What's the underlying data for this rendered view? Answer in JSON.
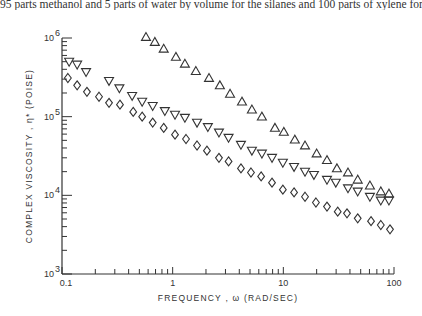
{
  "caption": "95 parts methanol and 5 parts of water by volume for the silanes and 100 parts of xylene for th",
  "chart_data": {
    "type": "scatter",
    "title": "",
    "xlabel": "FREQUENCY , ω (RAD/SEC)",
    "ylabel": "COMPLEX VISCOSITY , η* (POISE)",
    "xscale": "log",
    "yscale": "log",
    "xlim": [
      0.1,
      100
    ],
    "ylim": [
      1000,
      1000000
    ],
    "grid": false,
    "x_ticks": [
      {
        "value": 0.1,
        "label": "0.1"
      },
      {
        "value": 1,
        "label": "1"
      },
      {
        "value": 10,
        "label": "10"
      },
      {
        "value": 100,
        "label": "100"
      }
    ],
    "y_ticks": [
      {
        "value": 1000,
        "base": "10",
        "exp": "3"
      },
      {
        "value": 10000,
        "base": "10",
        "exp": "4"
      },
      {
        "value": 100000,
        "base": "10",
        "exp": "5"
      },
      {
        "value": 1000000,
        "base": "10",
        "exp": "6"
      }
    ],
    "series": [
      {
        "name": "up-triangle series",
        "marker": "triangle-up",
        "x": [
          0.574,
          0.69,
          0.83,
          1.07,
          1.29,
          1.62,
          2.13,
          2.67,
          3.3,
          4.23,
          5.2,
          6.4,
          8.4,
          10.1,
          12.7,
          15.7,
          20,
          24.8,
          30.5,
          38.4,
          47,
          60.6,
          76,
          90
        ],
        "y": [
          1030000,
          890000,
          730000,
          575000,
          470000,
          380000,
          310000,
          250000,
          195000,
          155000,
          123000,
          100000,
          72000,
          64000,
          51000,
          43000,
          34000,
          28000,
          22000,
          19500,
          15800,
          13300,
          11200,
          10500
        ]
      },
      {
        "name": "down-triangle series",
        "marker": "triangle-down",
        "x": [
          0.116,
          0.137,
          0.165,
          0.266,
          0.33,
          0.43,
          0.53,
          0.66,
          0.85,
          1.05,
          1.29,
          1.66,
          2.08,
          2.62,
          3.2,
          4.14,
          5.2,
          6.4,
          7.9,
          9.9,
          12.5,
          15.7,
          18.9,
          24.8,
          29.8,
          38.4,
          47,
          60.6,
          76,
          90
        ],
        "y": [
          500000,
          460000,
          370000,
          285000,
          230000,
          184000,
          155000,
          137000,
          118000,
          106000,
          97000,
          84000,
          74000,
          63000,
          54000,
          44000,
          37000,
          34000,
          30000,
          26000,
          23000,
          20000,
          18200,
          15800,
          14500,
          12300,
          11200,
          9600,
          8600,
          8600
        ]
      },
      {
        "name": "diamond series",
        "marker": "diamond",
        "x": [
          0.113,
          0.137,
          0.168,
          0.216,
          0.266,
          0.334,
          0.44,
          0.53,
          0.66,
          0.83,
          1.05,
          1.32,
          1.66,
          2.04,
          2.62,
          3.2,
          4.14,
          5.1,
          6.3,
          7.9,
          9.9,
          12.5,
          15.7,
          19.7,
          24.8,
          31,
          37.6,
          47,
          62,
          76,
          92
        ],
        "y": [
          310000,
          250000,
          207000,
          179000,
          150000,
          142000,
          115000,
          100000,
          84000,
          72000,
          59000,
          52000,
          43000,
          37000,
          30000,
          27000,
          22000,
          19500,
          17400,
          14500,
          11800,
          10900,
          9600,
          8100,
          7200,
          6200,
          5900,
          5100,
          4700,
          4200,
          3700
        ]
      }
    ]
  }
}
